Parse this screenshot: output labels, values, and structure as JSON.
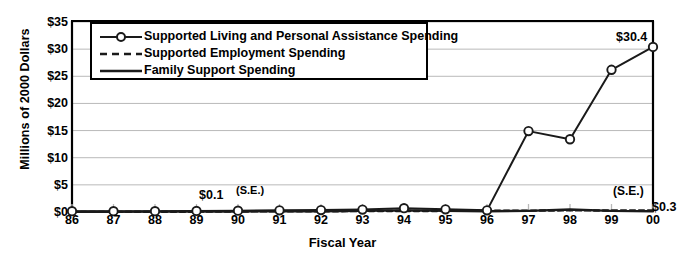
{
  "chart_data": {
    "type": "line",
    "title": "",
    "xlabel": "Fiscal Year",
    "ylabel": "Millions of 2000 Dollars",
    "categories": [
      "86",
      "87",
      "88",
      "89",
      "90",
      "91",
      "92",
      "93",
      "94",
      "95",
      "96",
      "97",
      "98",
      "99",
      "00"
    ],
    "x_tick_labels": [
      "86",
      "87",
      "88",
      "89",
      "90",
      "91",
      "92",
      "93",
      "94",
      "95",
      "96",
      "97",
      "98",
      "99",
      "00"
    ],
    "y_tick_labels": [
      "$0",
      "$5",
      "$10",
      "$15",
      "$20",
      "$25",
      "$30",
      "$35"
    ],
    "y_tick_values": [
      0,
      5,
      10,
      15,
      20,
      25,
      30,
      35
    ],
    "ylim": [
      0,
      35
    ],
    "grid": "horizontal",
    "legend_position": "top-left-inside",
    "series": [
      {
        "name": "Supported Living and Personal Assistance Spending",
        "marker": "open-circle",
        "line_style": "solid",
        "color": "#1a1a1a",
        "values": [
          0.15,
          0.15,
          0.15,
          0.2,
          0.25,
          0.3,
          0.35,
          0.45,
          0.7,
          0.5,
          0.3,
          14.9,
          13.4,
          26.2,
          30.4
        ]
      },
      {
        "name": "Supported Employment Spending",
        "marker": "none",
        "line_style": "dashed",
        "color": "#1a1a1a",
        "values": [
          0.02,
          0.03,
          0.04,
          0.06,
          0.1,
          0.12,
          0.14,
          0.16,
          0.18,
          0.2,
          0.22,
          0.25,
          0.3,
          0.28,
          0.3
        ]
      },
      {
        "name": "Family Support Spending",
        "marker": "none",
        "line_style": "solid",
        "color": "#1a1a1a",
        "values": [
          0.05,
          0.05,
          0.06,
          0.08,
          0.1,
          0.12,
          0.15,
          0.2,
          0.3,
          0.22,
          0.15,
          0.2,
          0.45,
          0.2,
          0.15
        ]
      }
    ],
    "annotations": [
      {
        "id": "se-1990-value",
        "text": "$0.1",
        "x_category": "90",
        "value": 0.1
      },
      {
        "id": "se-1990-label",
        "text": "(S.E.)",
        "x_category": "90",
        "value": 0.1
      },
      {
        "id": "slpa-2000-value",
        "text": "$30.4",
        "x_category": "00",
        "value": 30.4
      },
      {
        "id": "se-2000-label",
        "text": "(S.E.)",
        "x_category": "00",
        "value": 0.3
      },
      {
        "id": "se-2000-value",
        "text": "$0.3",
        "x_category": "00",
        "value": 0.3
      }
    ]
  },
  "legend": {
    "items": [
      {
        "label": "Supported Living and Personal Assistance Spending",
        "style": "marker-line"
      },
      {
        "label": "Supported Employment Spending",
        "style": "dashed"
      },
      {
        "label": "Family Support Spending",
        "style": "solid"
      }
    ]
  },
  "colors": {
    "axis": "#000000",
    "gridline": "#b9b9b9",
    "series": "#1a1a1a",
    "background": "#ffffff"
  }
}
